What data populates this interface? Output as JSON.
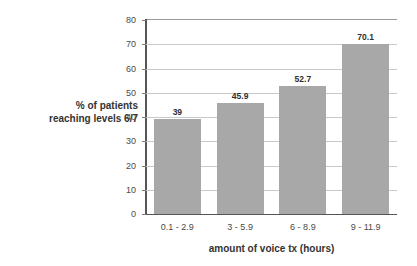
{
  "chart_data": {
    "type": "bar",
    "title": "",
    "subtitle": "",
    "categories": [
      "0.1 - 2.9",
      "3 - 5.9",
      "6 - 8.9",
      "9 - 11.9"
    ],
    "values": [
      39,
      45.9,
      52.7,
      70.1
    ],
    "value_labels": [
      "39",
      "45.9",
      "52.7",
      "70.1"
    ],
    "xlabel": "amount of voice tx (hours)",
    "ylabel_lines": [
      "% of patients",
      "reaching levels 6/7"
    ],
    "ylabel": "% of patients reaching levels 6/7",
    "ylim": [
      0,
      80
    ],
    "ytick_values": [
      0,
      10,
      20,
      30,
      40,
      50,
      60,
      70,
      80
    ],
    "ytick_labels": [
      "0",
      "10",
      "20",
      "30",
      "40",
      "50",
      "60",
      "70",
      "80"
    ],
    "grid": true,
    "grid_axis": "y",
    "legend": false,
    "legend_position": "none",
    "bar_color": "#a8a8a8",
    "grid_color": "#c9c9c9",
    "axis_color": "#555555",
    "background_color": "#ffffff",
    "text_color": "#3a3a3a"
  }
}
